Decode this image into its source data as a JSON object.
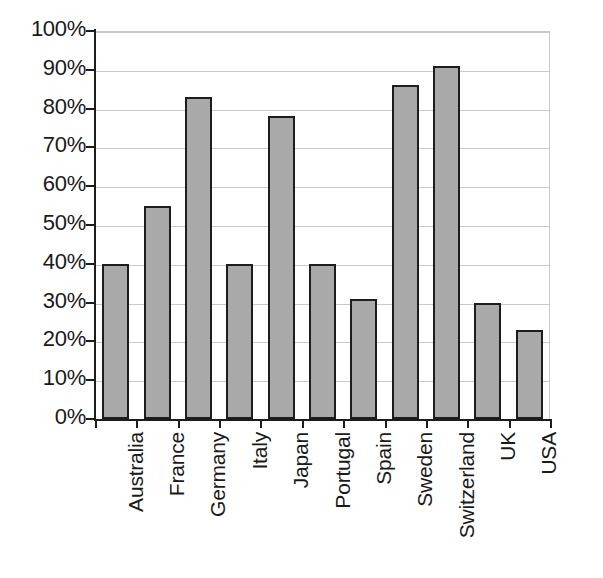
{
  "chart_data": {
    "type": "bar",
    "title": "",
    "xlabel": "",
    "ylabel": "",
    "categories": [
      "Australia",
      "France",
      "Germany",
      "Italy",
      "Japan",
      "Portugal",
      "Spain",
      "Sweden",
      "Switzerland",
      "UK",
      "USA"
    ],
    "values": [
      40,
      55,
      83,
      40,
      78,
      40,
      31,
      86,
      91,
      30,
      23
    ],
    "value_suffix": "%",
    "ylim": [
      0,
      100
    ],
    "ytick_values": [
      0,
      10,
      20,
      30,
      40,
      50,
      60,
      70,
      80,
      90,
      100
    ],
    "ytick_labels": [
      "0%",
      "10%",
      "20%",
      "30%",
      "40%",
      "50%",
      "60%",
      "70%",
      "80%",
      "90%",
      "100%"
    ],
    "grid": true,
    "legend": false,
    "legend_position": "none",
    "bar_fill_color": "#a9a9a9",
    "bar_border_color": "#1d1d1d",
    "gridline_color": "#c9c9c9",
    "axis_color": "#1d1d1d",
    "background_color": "#ffffff",
    "text_color": "#1a1a1a",
    "category_label_rotation": -90
  }
}
